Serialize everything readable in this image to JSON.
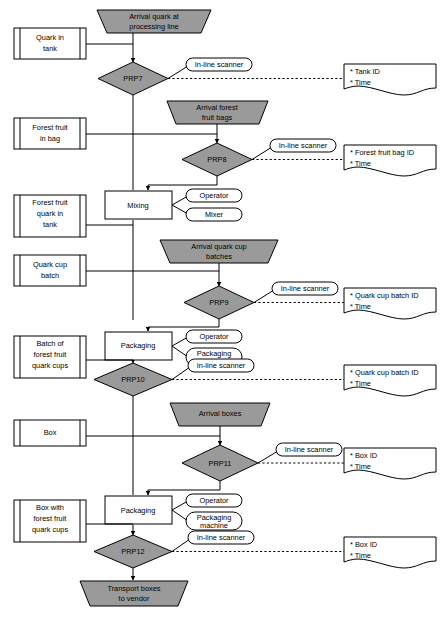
{
  "diagram": {
    "type": "process-flowchart",
    "colors": {
      "process_fill": "#9a9a9a",
      "node_fill": "#ffffff",
      "line": "#000000"
    }
  },
  "terminals": [
    {
      "id": "start",
      "label_line1": "Arrival quark at",
      "label_line2": "processing line"
    },
    {
      "id": "end",
      "label_line1": "Transport boxes",
      "label_line2": "to vendor"
    }
  ],
  "arrivals": [
    {
      "id": "arrival_bags",
      "label_line1": "Arrival forest",
      "label_line2": "fruit bags"
    },
    {
      "id": "arrival_cups",
      "label_line1": "Arrival quark cup",
      "label_line2": "batches"
    },
    {
      "id": "arrival_boxes",
      "label_line1": "Arrival boxes",
      "label_line2": ""
    }
  ],
  "storages": [
    {
      "id": "quark_tank",
      "lines": [
        "Quark in",
        "tank"
      ]
    },
    {
      "id": "fruit_bag",
      "lines": [
        "Forest fruit",
        "in bag"
      ]
    },
    {
      "id": "fruit_quark_tank",
      "lines": [
        "Forest fruit",
        "quark in",
        "tank"
      ]
    },
    {
      "id": "quark_cup_batch",
      "lines": [
        "Quark cup",
        "batch"
      ]
    },
    {
      "id": "batch_cups",
      "lines": [
        "Batch of",
        "forest fruit",
        "quark cups"
      ]
    },
    {
      "id": "box",
      "lines": [
        "Box"
      ]
    },
    {
      "id": "box_with_cups",
      "lines": [
        "Box with",
        "forest fruit",
        "quark cups"
      ]
    }
  ],
  "prp_points": [
    {
      "id": "prp7",
      "label": "PRP7"
    },
    {
      "id": "prp8",
      "label": "PRP8"
    },
    {
      "id": "prp9",
      "label": "PRP9"
    },
    {
      "id": "prp10",
      "label": "PRP10"
    },
    {
      "id": "prp11",
      "label": "PRP11"
    },
    {
      "id": "prp12",
      "label": "PRP12"
    }
  ],
  "operations": [
    {
      "id": "mixing",
      "label": "Mixing",
      "resources": [
        {
          "label": "Operator"
        },
        {
          "label": "Mixer"
        }
      ]
    },
    {
      "id": "packaging_cups",
      "label": "Packaging",
      "resources": [
        {
          "label": "Operator"
        },
        {
          "label_line1": "Packaging",
          "label_line2": "machine"
        }
      ]
    },
    {
      "id": "packaging_boxes",
      "label": "Packaging",
      "resources": [
        {
          "label": "Operator"
        },
        {
          "label_line1": "Packaging",
          "label_line2": "machine"
        }
      ]
    }
  ],
  "scanners": [
    {
      "id": "scanner_prp7",
      "label": "In-line scanner"
    },
    {
      "id": "scanner_prp8",
      "label": "In-line scanner"
    },
    {
      "id": "scanner_prp9",
      "label": "In-line scanner"
    },
    {
      "id": "scanner_prp10",
      "label": "In-line scanner"
    },
    {
      "id": "scanner_prp11",
      "label": "In-line scanner"
    },
    {
      "id": "scanner_prp12",
      "label": "In-line scanner"
    }
  ],
  "records": [
    {
      "id": "rec_prp7",
      "items": [
        "* Tank ID",
        "* Time"
      ]
    },
    {
      "id": "rec_prp8",
      "items": [
        "* Forest fruit bag ID",
        "* Time"
      ]
    },
    {
      "id": "rec_prp9",
      "items": [
        "* Quark cup batch ID",
        "* Time"
      ]
    },
    {
      "id": "rec_prp10",
      "items": [
        "* Quark cup batch ID",
        "* Time"
      ]
    },
    {
      "id": "rec_prp11",
      "items": [
        "* Box ID",
        "* Time"
      ]
    },
    {
      "id": "rec_prp12",
      "items": [
        "* Box ID",
        "* Time"
      ]
    }
  ]
}
